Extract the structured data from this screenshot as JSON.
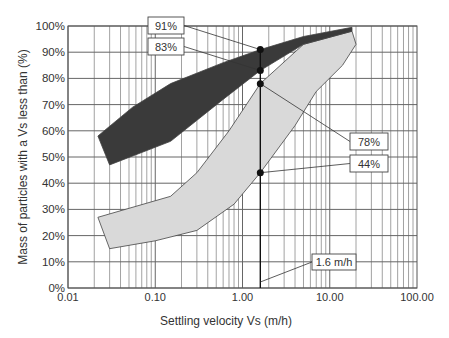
{
  "chart_data": {
    "type": "area",
    "title": "",
    "xlabel": "Settling velocity Vs (m/h)",
    "ylabel": "Mass of particles with a Vs less than (%)",
    "x_scale": "log",
    "xlim": [
      0.01,
      100
    ],
    "ylim": [
      0,
      100
    ],
    "x_tick_labels": [
      "0.01",
      "0.10",
      "1.00",
      "10.00",
      "100.00"
    ],
    "y_tick_labels": [
      "0%",
      "10%",
      "20%",
      "30%",
      "40%",
      "50%",
      "60%",
      "70%",
      "80%",
      "90%",
      "100%"
    ],
    "grid": true,
    "series": [
      {
        "name": "Dark band (upper envelope region)",
        "color": "#3a3a3a",
        "upper_boundary": [
          [
            0.022,
            58
          ],
          [
            0.055,
            69
          ],
          [
            0.15,
            78
          ],
          [
            0.6,
            86
          ],
          [
            1.6,
            91
          ],
          [
            5,
            96
          ],
          [
            18,
            99.5
          ]
        ],
        "lower_boundary": [
          [
            0.03,
            47
          ],
          [
            0.15,
            56
          ],
          [
            0.6,
            72
          ],
          [
            1.6,
            83
          ],
          [
            5,
            93
          ],
          [
            18,
            98
          ]
        ]
      },
      {
        "name": "Light band (lower envelope region)",
        "color": "#d9d9d9",
        "upper_boundary": [
          [
            0.022,
            27
          ],
          [
            0.15,
            35
          ],
          [
            0.3,
            44
          ],
          [
            0.7,
            60
          ],
          [
            1.6,
            78
          ],
          [
            5,
            93
          ],
          [
            18,
            98
          ]
        ],
        "lower_boundary": [
          [
            0.03,
            15
          ],
          [
            0.1,
            18
          ],
          [
            0.3,
            22
          ],
          [
            0.8,
            32
          ],
          [
            1.6,
            44
          ],
          [
            4,
            62
          ],
          [
            7,
            75
          ],
          [
            14,
            85
          ],
          [
            20,
            93
          ]
        ]
      }
    ],
    "annotations": [
      {
        "label": "91%",
        "x": 1.6,
        "y": 91
      },
      {
        "label": "83%",
        "x": 1.6,
        "y": 83
      },
      {
        "label": "78%",
        "x": 1.6,
        "y": 78
      },
      {
        "label": "44%",
        "x": 1.6,
        "y": 44
      },
      {
        "label": "1.6 m/h",
        "x": 1.6,
        "y": 0
      }
    ],
    "vertical_line": {
      "x": 1.6
    }
  }
}
